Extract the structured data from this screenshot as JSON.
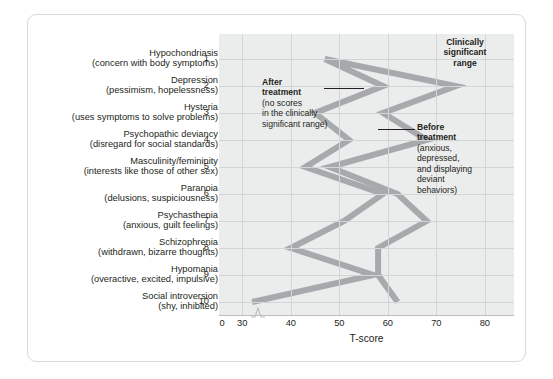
{
  "figure": {
    "axis_title": "T-score",
    "x_ticks": [
      "0",
      "30",
      "40",
      "50",
      "60",
      "70",
      "80"
    ],
    "x_tick_values": [
      0,
      30,
      40,
      50,
      60,
      70,
      80
    ],
    "scales": [
      {
        "num": "1",
        "name": "Hypochondriasis",
        "desc": "(concern with body symptoms)"
      },
      {
        "num": "2",
        "name": "Depression",
        "desc": "(pessimism, hopelessness)"
      },
      {
        "num": "3",
        "name": "Hysteria",
        "desc": "(uses symptoms to solve problems)"
      },
      {
        "num": "4",
        "name": "Psychopathic deviancy",
        "desc": "(disregard for social standards)"
      },
      {
        "num": "5",
        "name": "Masculinity/femininity",
        "desc": "(interests like those of other sex)"
      },
      {
        "num": "6",
        "name": "Paranoia",
        "desc": "(delusions, suspiciousness)"
      },
      {
        "num": "7",
        "name": "Psychasthenia",
        "desc": "(anxious, guilt feelings)"
      },
      {
        "num": "8",
        "name": "Schizophrenia",
        "desc": "(withdrawn, bizarre thoughts)"
      },
      {
        "num": "9",
        "name": "Hypomania",
        "desc": "(overactive, excited, impulsive)"
      },
      {
        "num": "10",
        "name": "Social introversion",
        "desc": "(shy, inhibited)"
      }
    ],
    "annotations": {
      "clinically_significant": "Clinically\nsignificant\nrange",
      "clinically_significant_l1": "Clinically",
      "clinically_significant_l2": "significant",
      "clinically_significant_l3": "range",
      "after_title_l1": "After",
      "after_title_l2": "treatment",
      "after_body_l1": "(no scores",
      "after_body_l2": "in the clinically",
      "after_body_l3": "significant range)",
      "before_title_l1": "Before",
      "before_title_l2": "treatment",
      "before_body_l1": "(anxious,",
      "before_body_l2": "depressed,",
      "before_body_l3": "and displaying",
      "before_body_l4": "deviant",
      "before_body_l5": "behaviors)"
    }
  },
  "colors": {
    "line": "#a7a9ac",
    "plot_background": "#ebecec",
    "gridline": "#d2d4d5",
    "text": "#231f20",
    "frame": "#d8d9da"
  },
  "chart_data": {
    "type": "line",
    "title": "",
    "xlabel": "T-score",
    "ylabel": "",
    "xlim": [
      25,
      86
    ],
    "grid": true,
    "orientation": "horizontal-profile",
    "categories": [
      "1 Hypochondriasis",
      "2 Depression",
      "3 Hysteria",
      "4 Psychopathic deviancy",
      "5 Masculinity/femininity",
      "6 Paranoia",
      "7 Psychasthenia",
      "8 Schizophrenia",
      "9 Hypomania",
      "10 Social introversion"
    ],
    "series": [
      {
        "name": "Before treatment",
        "values": [
          47,
          74,
          59,
          68,
          48,
          62,
          68,
          58,
          58,
          62
        ]
      },
      {
        "name": "After treatment",
        "values": [
          47,
          59,
          45,
          52,
          43,
          59,
          51,
          40,
          57,
          32
        ]
      }
    ],
    "legend_position": "inline-annotations",
    "annotations": [
      "Clinically significant range",
      "After treatment (no scores in the clinically significant range)",
      "Before treatment (anxious, depressed, and displaying deviant behaviors)"
    ]
  }
}
